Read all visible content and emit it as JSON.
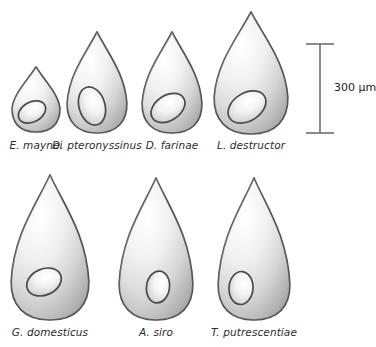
{
  "figure": {
    "background_color": "#ffffff",
    "outline_color": "#4a4a4a",
    "shell_light": "#fdfdfd",
    "shell_mid": "#d9d9d9",
    "shell_dark": "#9a9a9a",
    "inner_light": "#ffffff",
    "inner_mid": "#d2d2d2",
    "label_color": "#2b2b2b"
  },
  "scale_bar": {
    "label": "300 µm",
    "value": 300,
    "unit": "µm",
    "x": 320,
    "top_y": 44,
    "bottom_y": 133,
    "cap_half_width": 14,
    "color": "#6f6f6f",
    "label_x": 334,
    "label_y": 89
  },
  "rows": [
    {
      "name": "top-row",
      "eggs": [
        {
          "id": "e-maynei",
          "label": "E. maynei",
          "cx": 36,
          "tip_y": 67,
          "base_y": 132,
          "half_width": 24,
          "label_x": 36,
          "label_y": 147,
          "inner": {
            "cx": 32,
            "cy": 112,
            "rx": 14.5,
            "ry": 10,
            "rot": -28
          }
        },
        {
          "id": "d-pteronyssinus",
          "label": "D. pteronyssinus",
          "cx": 97,
          "tip_y": 32,
          "base_y": 133,
          "half_width": 30,
          "label_x": 97,
          "label_y": 147,
          "inner": {
            "cx": 92,
            "cy": 106,
            "rx": 13,
            "ry": 19.5,
            "rot": -16
          }
        },
        {
          "id": "d-farinae",
          "label": "D. farinae",
          "cx": 172,
          "tip_y": 32,
          "base_y": 133,
          "half_width": 30,
          "label_x": 172,
          "label_y": 147,
          "inner": {
            "cx": 168,
            "cy": 108,
            "rx": 18.5,
            "ry": 12.5,
            "rot": -33
          }
        },
        {
          "id": "l-destructor",
          "label": "L. destructor",
          "cx": 251,
          "tip_y": 12,
          "base_y": 134,
          "half_width": 37,
          "label_x": 251,
          "label_y": 147,
          "inner": {
            "cx": 247,
            "cy": 107,
            "rx": 20.5,
            "ry": 14,
            "rot": -32
          }
        }
      ]
    },
    {
      "name": "bottom-row",
      "eggs": [
        {
          "id": "g-domesticus",
          "label": "G. domesticus",
          "cx": 50,
          "tip_y": 175,
          "base_y": 320,
          "half_width": 39,
          "label_x": 50,
          "label_y": 334,
          "inner": {
            "cx": 44,
            "cy": 282,
            "rx": 18,
            "ry": 13,
            "rot": -24
          }
        },
        {
          "id": "a-siro",
          "label": "A. siro",
          "cx": 156,
          "tip_y": 178,
          "base_y": 320,
          "half_width": 37,
          "label_x": 156,
          "label_y": 334,
          "inner": {
            "cx": 158,
            "cy": 287,
            "rx": 11.5,
            "ry": 16,
            "rot": 8
          }
        },
        {
          "id": "t-putrescentiae",
          "label": "T. putrescentiae",
          "cx": 254,
          "tip_y": 178,
          "base_y": 320,
          "half_width": 36,
          "label_x": 254,
          "label_y": 334,
          "inner": {
            "cx": 241,
            "cy": 288,
            "rx": 12,
            "ry": 16.5,
            "rot": 4
          }
        }
      ]
    }
  ]
}
